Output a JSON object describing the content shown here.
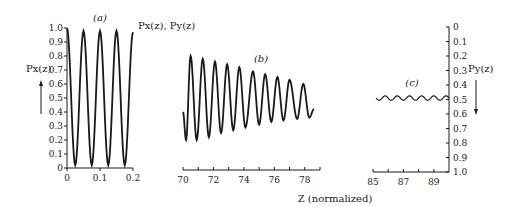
{
  "chart_data": [
    {
      "type": "line",
      "panel_label": "(a)",
      "series_label": "Px(z), Py(z)",
      "ylabel": "Px(z)",
      "ylabel_arrow": "up",
      "xlim": [
        0,
        0.2
      ],
      "ylim": [
        0,
        1.0
      ],
      "xticks": [
        "0",
        "0.1",
        "0.2"
      ],
      "yticks": [
        "0",
        "0.1",
        "0.2",
        "0.3",
        "0.4",
        "0.5",
        "0.6",
        "0.7",
        "0.8",
        "0.9",
        "1.0"
      ],
      "series": [
        {
          "name": "Px(z)",
          "x": [
            0,
            0.012,
            0.025,
            0.037,
            0.05,
            0.062,
            0.075,
            0.087,
            0.1,
            0.112,
            0.125,
            0.137,
            0.15,
            0.162,
            0.175,
            0.187,
            0.2
          ],
          "y": [
            1.0,
            0.5,
            0.02,
            0.5,
            0.98,
            0.5,
            0.02,
            0.5,
            0.98,
            0.5,
            0.02,
            0.5,
            0.98,
            0.5,
            0.02,
            0.5,
            0.97
          ]
        }
      ]
    },
    {
      "type": "line",
      "panel_label": "(b)",
      "xlim": [
        70,
        79
      ],
      "xticks": [
        "70",
        "72",
        "74",
        "76",
        "78"
      ],
      "series": [
        {
          "name": "Px(z)",
          "peaks": [
            {
              "x": 70.5,
              "y": 0.8
            },
            {
              "x": 71.3,
              "y": 0.78
            },
            {
              "x": 72.1,
              "y": 0.76
            },
            {
              "x": 72.9,
              "y": 0.74
            },
            {
              "x": 73.7,
              "y": 0.72
            },
            {
              "x": 74.6,
              "y": 0.69
            },
            {
              "x": 75.4,
              "y": 0.67
            },
            {
              "x": 76.2,
              "y": 0.65
            },
            {
              "x": 77.0,
              "y": 0.63
            },
            {
              "x": 77.9,
              "y": 0.6
            }
          ],
          "troughs": [
            {
              "x": 70.2,
              "y": 0.2
            },
            {
              "x": 70.9,
              "y": 0.2
            },
            {
              "x": 71.7,
              "y": 0.22
            },
            {
              "x": 72.5,
              "y": 0.25
            },
            {
              "x": 73.3,
              "y": 0.27
            },
            {
              "x": 74.1,
              "y": 0.29
            },
            {
              "x": 75.0,
              "y": 0.31
            },
            {
              "x": 75.8,
              "y": 0.33
            },
            {
              "x": 76.6,
              "y": 0.34
            },
            {
              "x": 77.5,
              "y": 0.35
            },
            {
              "x": 78.3,
              "y": 0.36
            }
          ],
          "start": {
            "x": 70.0,
            "y": 0.4
          },
          "end": {
            "x": 78.6,
            "y": 0.42
          }
        }
      ]
    },
    {
      "type": "line",
      "panel_label": "(c)",
      "ylabel": "Py(z)",
      "ylabel_arrow": "down",
      "xlim": [
        85,
        90
      ],
      "ylim": [
        0,
        1.0
      ],
      "xticks": [
        "85",
        "87",
        "89"
      ],
      "yticks": [
        "0",
        "0.1",
        "0.2",
        "0.3",
        "0.4",
        "0.5",
        "0.6",
        "0.7",
        "0.8",
        "0.9",
        "1.0"
      ],
      "series": [
        {
          "name": "Py(z)",
          "center": 0.49,
          "amplitude": 0.015,
          "cycles": 6,
          "x_range": [
            85.2,
            90
          ]
        }
      ]
    }
  ],
  "xlabel": "Z (normalized)"
}
